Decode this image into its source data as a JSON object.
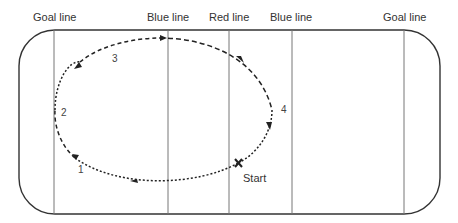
{
  "diagram": {
    "type": "hockey-rink-skating-drill",
    "line_labels": {
      "goal_left": "Goal line",
      "blue_left": "Blue line",
      "red": "Red line",
      "blue_right": "Blue line",
      "goal_right": "Goal line"
    },
    "path_points": [
      "1",
      "2",
      "3",
      "4"
    ],
    "start_label": "Start",
    "start_marker": "X",
    "colors": {
      "rink_border": "#333333",
      "lines": "#777777",
      "path": "#222222"
    }
  }
}
